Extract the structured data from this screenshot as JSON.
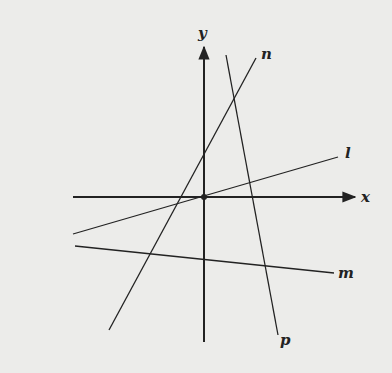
{
  "diagram": {
    "type": "coordinate-plane-lines",
    "axes": {
      "x_label": "x",
      "y_label": "y",
      "origin_marked": true
    },
    "lines": [
      {
        "name": "l",
        "label": "l",
        "x1": 73,
        "y1": 234,
        "x2": 338,
        "y2": 157,
        "label_x": 345,
        "label_y": 158
      },
      {
        "name": "m",
        "label": "m",
        "x1": 75,
        "y1": 246,
        "x2": 334,
        "y2": 273,
        "label_x": 338,
        "label_y": 278
      },
      {
        "name": "n",
        "label": "n",
        "x1": 109,
        "y1": 330,
        "x2": 256,
        "y2": 58,
        "label_x": 261,
        "label_y": 59
      },
      {
        "name": "p",
        "label": "p",
        "x1": 226,
        "y1": 55,
        "x2": 278,
        "y2": 335,
        "label_x": 280,
        "label_y": 345
      }
    ],
    "colors": {
      "ink": "#222222",
      "background": "#ececea"
    }
  }
}
